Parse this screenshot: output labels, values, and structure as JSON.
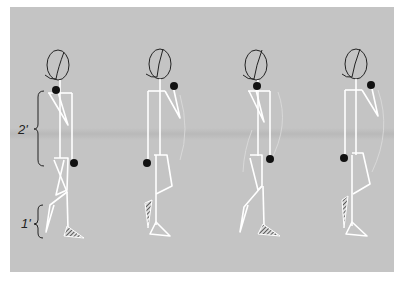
{
  "diagram": {
    "background_color": "#c4c4c4",
    "line_color": "#ffffff",
    "joint_color": "#111111",
    "labels": {
      "torso_measure": "2'",
      "lower_leg_measure": "1'"
    },
    "figures": [
      {
        "id": 1,
        "phase": "right leg forward, left arm forward"
      },
      {
        "id": 2,
        "phase": "arm raised forward, rear foot lifting"
      },
      {
        "id": 3,
        "phase": "mirror of figure 1"
      },
      {
        "id": 4,
        "phase": "mirror of figure 2"
      }
    ]
  }
}
